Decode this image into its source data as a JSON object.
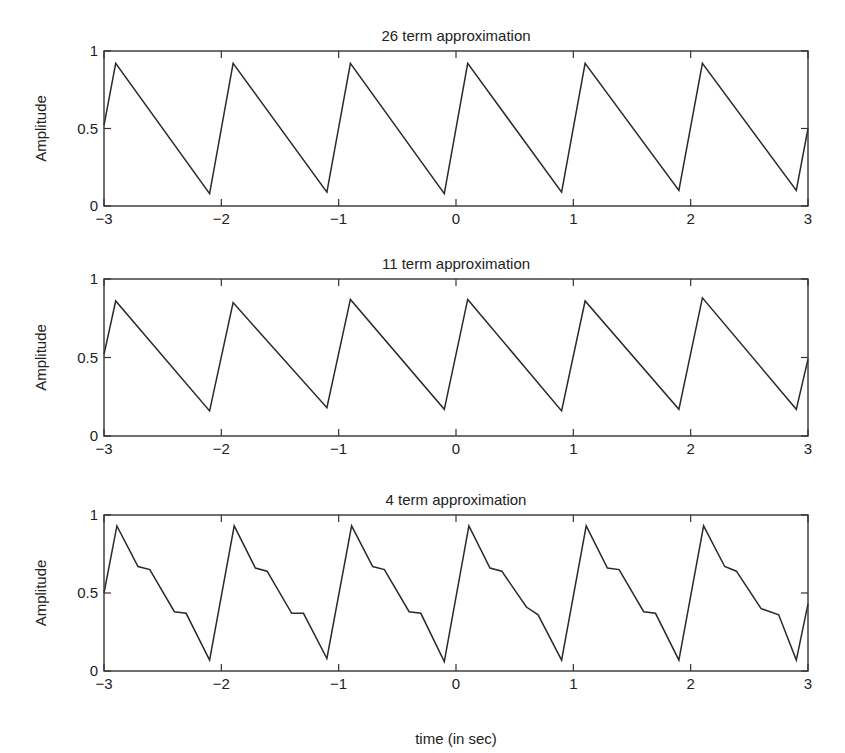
{
  "figure": {
    "xlabel": "time (in sec)"
  },
  "chart_data": [
    {
      "type": "line",
      "title": "26 term approximation",
      "xlabel": "",
      "ylabel": "Amplitude",
      "xlim": [
        -3,
        3
      ],
      "ylim": [
        0,
        1
      ],
      "xticks": [
        -3,
        -2,
        -1,
        0,
        1,
        2,
        3
      ],
      "xtick_labels": [
        "−3",
        "−2",
        "−1",
        "0",
        "1",
        "2",
        "3"
      ],
      "yticks": [
        0,
        0.5,
        1
      ],
      "ytick_labels": [
        "0",
        "0.5",
        "1"
      ],
      "grid": false,
      "series": [
        {
          "name": "26 term",
          "x": [
            -3,
            -2.9,
            -2.1,
            -1.9,
            -1.1,
            -0.9,
            -0.1,
            0.1,
            0.9,
            1.1,
            1.9,
            2.1,
            2.9,
            3
          ],
          "y": [
            0.52,
            0.92,
            0.08,
            0.92,
            0.09,
            0.92,
            0.08,
            0.92,
            0.09,
            0.92,
            0.1,
            0.92,
            0.1,
            0.5
          ]
        }
      ]
    },
    {
      "type": "line",
      "title": "11 term approximation",
      "xlabel": "",
      "ylabel": "Amplitude",
      "xlim": [
        -3,
        3
      ],
      "ylim": [
        0,
        1
      ],
      "xticks": [
        -3,
        -2,
        -1,
        0,
        1,
        2,
        3
      ],
      "xtick_labels": [
        "−3",
        "−2",
        "−1",
        "0",
        "1",
        "2",
        "3"
      ],
      "yticks": [
        0,
        0.5,
        1
      ],
      "ytick_labels": [
        "0",
        "0.5",
        "1"
      ],
      "grid": false,
      "series": [
        {
          "name": "11 term",
          "x": [
            -3,
            -2.9,
            -2.1,
            -1.9,
            -1.1,
            -0.9,
            -0.1,
            0.1,
            0.9,
            1.1,
            1.9,
            2.1,
            2.9,
            3
          ],
          "y": [
            0.52,
            0.86,
            0.16,
            0.85,
            0.18,
            0.87,
            0.17,
            0.87,
            0.16,
            0.86,
            0.17,
            0.88,
            0.17,
            0.49
          ]
        }
      ]
    },
    {
      "type": "line",
      "title": "4 term approximation",
      "xlabel": "time (in sec)",
      "ylabel": "Amplitude",
      "xlim": [
        -3,
        3
      ],
      "ylim": [
        0,
        1
      ],
      "xticks": [
        -3,
        -2,
        -1,
        0,
        1,
        2,
        3
      ],
      "xtick_labels": [
        "−3",
        "−2",
        "−1",
        "0",
        "1",
        "2",
        "3"
      ],
      "yticks": [
        0,
        0.5,
        1
      ],
      "ytick_labels": [
        "0",
        "0.5",
        "1"
      ],
      "grid": false,
      "series": [
        {
          "name": "4 term",
          "x": [
            -3,
            -2.89,
            -2.71,
            -2.61,
            -2.4,
            -2.3,
            -2.1,
            -1.89,
            -1.71,
            -1.61,
            -1.4,
            -1.3,
            -1.1,
            -0.89,
            -0.71,
            -0.61,
            -0.4,
            -0.3,
            -0.1,
            0.11,
            0.29,
            0.39,
            0.6,
            0.7,
            0.9,
            1.11,
            1.29,
            1.39,
            1.6,
            1.7,
            1.9,
            2.11,
            2.29,
            2.39,
            2.6,
            2.75,
            2.9,
            3
          ],
          "y": [
            0.5,
            0.93,
            0.67,
            0.65,
            0.38,
            0.37,
            0.07,
            0.93,
            0.66,
            0.64,
            0.37,
            0.37,
            0.08,
            0.93,
            0.67,
            0.65,
            0.38,
            0.37,
            0.06,
            0.93,
            0.66,
            0.64,
            0.41,
            0.36,
            0.07,
            0.93,
            0.66,
            0.65,
            0.38,
            0.37,
            0.07,
            0.93,
            0.67,
            0.64,
            0.4,
            0.36,
            0.07,
            0.43
          ]
        }
      ]
    }
  ]
}
